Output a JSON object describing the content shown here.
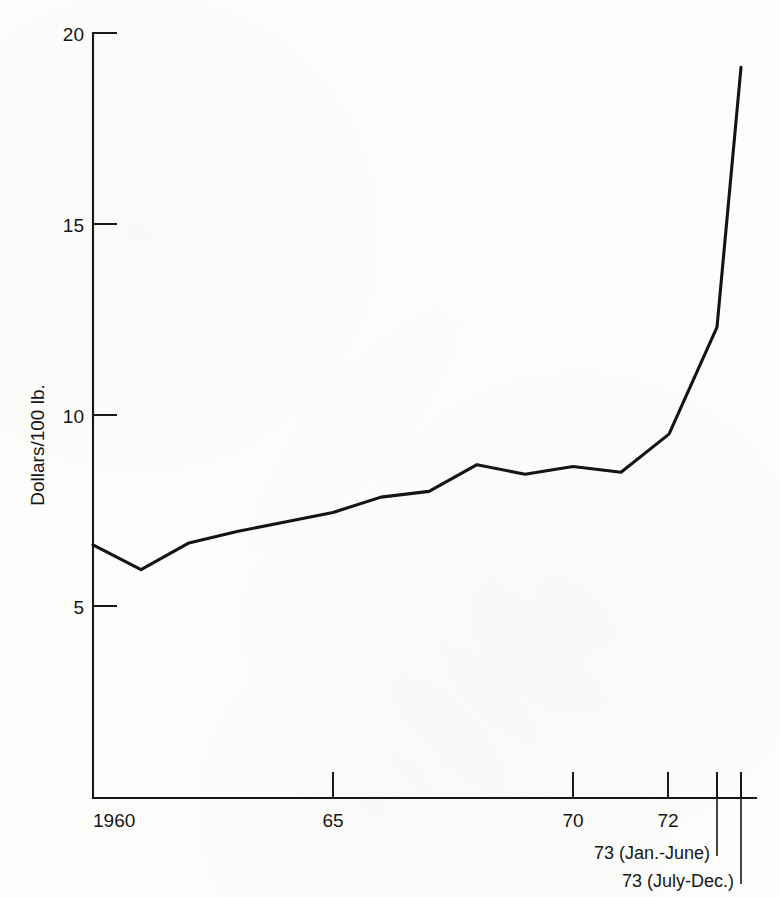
{
  "page": {
    "folio": "72",
    "running_head": "OUR DEPLETING RESOURCES"
  },
  "chart_data": {
    "type": "line",
    "title": "",
    "subtitle": "",
    "xlabel": "",
    "ylabel": "Dollars/100 lb.",
    "ylim": [
      0,
      20
    ],
    "xlim": [
      1960,
      1973.5
    ],
    "grid": false,
    "legend": null,
    "yticks": [
      5,
      10,
      15,
      20
    ],
    "ytick_labels": [
      "5",
      "10",
      "15",
      "20"
    ],
    "xticks": [
      1960,
      1965,
      1970,
      1972,
      1973,
      1973.5
    ],
    "xtick_labels": [
      "1960",
      "65",
      "70",
      "72",
      "",
      ""
    ],
    "annotations": [
      {
        "name": "jan-june-1973",
        "text": "73 (Jan.-June)",
        "x": 1973.0
      },
      {
        "name": "july-dec-1973",
        "text": "73 (July-Dec.)",
        "x": 1973.5
      }
    ],
    "x": [
      1960,
      1961,
      1962,
      1963,
      1964,
      1965,
      1966,
      1967,
      1968,
      1969,
      1970,
      1971,
      1972,
      1973.0,
      1973.5
    ],
    "values": [
      6.6,
      5.95,
      6.65,
      6.95,
      7.2,
      7.45,
      7.85,
      8.0,
      8.7,
      8.45,
      8.65,
      8.5,
      9.5,
      12.3,
      19.1
    ],
    "series": [
      {
        "name": "Price",
        "values": [
          6.6,
          5.95,
          6.65,
          6.95,
          7.2,
          7.45,
          7.85,
          8.0,
          8.7,
          8.45,
          8.65,
          8.5,
          9.5,
          12.3,
          19.1
        ]
      }
    ],
    "colors": {
      "line": "#141414",
      "axis": "#191919",
      "background": "#fdfdfb"
    }
  }
}
